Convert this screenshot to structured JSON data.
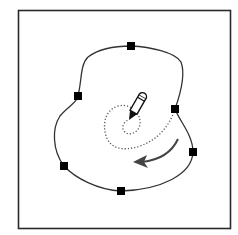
{
  "diagram": {
    "colors": {
      "background": "#ffffff",
      "frame": "#2a2a2a",
      "path": "#333333",
      "anchor": "#000000",
      "dotted": "#555555",
      "arrow": "#444444"
    },
    "anchors": [
      {
        "x": 131,
        "y": 46
      },
      {
        "x": 175,
        "y": 109
      },
      {
        "x": 193,
        "y": 152
      },
      {
        "x": 121,
        "y": 191
      },
      {
        "x": 64,
        "y": 166
      },
      {
        "x": 78,
        "y": 96
      }
    ],
    "icons": [
      "pencil-icon",
      "direction-arrow-icon"
    ]
  }
}
